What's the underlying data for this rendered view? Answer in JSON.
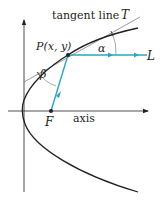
{
  "diagram": {
    "labels": {
      "tangent_line": "tangent line",
      "tangent_symbol": "T",
      "point": "P(x, y)",
      "alpha": "α",
      "beta": "β",
      "focus": "F",
      "axis": "axis",
      "ray_end": "L"
    },
    "colors": {
      "curve": "#231f20",
      "axes": "#231f20",
      "tangent": "#6d6e71",
      "ray": "#2aa4c4",
      "background": "#ffffff"
    },
    "geometry": {
      "vertex": [
        23,
        111
      ],
      "point_P": [
        68,
        55
      ],
      "focus_F": [
        51,
        111
      ],
      "L_end": [
        148,
        55
      ]
    }
  }
}
